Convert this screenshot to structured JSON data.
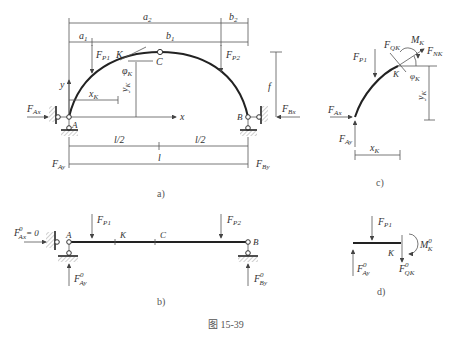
{
  "figure": {
    "caption": "图   15-39",
    "panels": {
      "a": {
        "label": "a)",
        "dims": {
          "a2": "a",
          "a2_sub": "2",
          "a1": "a",
          "a1_sub": "1",
          "b1": "b",
          "b1_sub": "1",
          "b2": "b",
          "b2_sub": "2",
          "f": "f",
          "half1": "l/2",
          "half2": "l/2",
          "full": "l",
          "xK": "x",
          "xK_sub": "K",
          "yK": "y",
          "yK_sub": "K"
        },
        "points": {
          "A": "A",
          "B": "B",
          "C": "C",
          "K": "K"
        },
        "forces": {
          "FP1": "F",
          "FP1_sub": "P1",
          "FP2": "F",
          "FP2_sub": "P2",
          "FAx": "F",
          "FAx_sub": "Ax",
          "FBx": "F",
          "FBx_sub": "Bx",
          "FAy": "F",
          "FAy_sub": "Ay",
          "FBy": "F",
          "FBy_sub": "By"
        },
        "angle": "φ",
        "angle_sub": "K",
        "axes": {
          "x": "x",
          "y": "y"
        }
      },
      "b": {
        "label": "b)",
        "points": {
          "A": "A",
          "B": "B",
          "C": "C",
          "K": "K"
        },
        "forces": {
          "FAx0": "F",
          "FAx0_sup": "0",
          "FAx0_sub": "Ax",
          "FAx0_val": "= 0",
          "FP1": "F",
          "FP1_sub": "P1",
          "FP2": "F",
          "FP2_sub": "P2",
          "FAy0": "F",
          "FAy0_sup": "0",
          "FAy0_sub": "Ay",
          "FBy0": "F",
          "FBy0_sup": "0",
          "FBy0_sub": "By"
        }
      },
      "c": {
        "label": "c)",
        "points": {
          "K": "K"
        },
        "forces": {
          "FQK": "F",
          "FQK_sub": "QK",
          "MK": "M",
          "MK_sub": "K",
          "FNK": "F",
          "FNK_sub": "NK",
          "FP1": "F",
          "FP1_sub": "P1",
          "FAx": "F",
          "FAx_sub": "Ax",
          "FAy": "F",
          "FAy_sub": "Ay"
        },
        "angle": "φ",
        "angle_sub": "K",
        "dims": {
          "xK": "x",
          "xK_sub": "K",
          "yK": "y",
          "yK_sub": "K"
        }
      },
      "d": {
        "label": "d)",
        "points": {
          "K": "K"
        },
        "forces": {
          "FP1": "F",
          "FP1_sub": "P1",
          "MK0": "M",
          "MK0_sup": "0",
          "MK0_sub": "K",
          "FAy0": "F",
          "FAy0_sup": "0",
          "FAy0_sub": "Ay",
          "FQK0": "F",
          "FQK0_sup": "0",
          "FQK0_sub": "QK"
        }
      }
    }
  }
}
